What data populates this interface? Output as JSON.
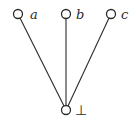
{
  "diagram": {
    "type": "hasse-diagram",
    "nodes": [
      {
        "id": "a",
        "label": "a",
        "cx": 18,
        "cy": 14,
        "r": 4.5,
        "label_x": 30,
        "label_y": 19
      },
      {
        "id": "b",
        "label": "b",
        "cx": 66,
        "cy": 14,
        "r": 4.5,
        "label_x": 76,
        "label_y": 19
      },
      {
        "id": "c",
        "label": "c",
        "cx": 111,
        "cy": 14,
        "r": 4.5,
        "label_x": 121,
        "label_y": 19
      },
      {
        "id": "bottom",
        "label": "⊥",
        "cx": 66,
        "cy": 110,
        "r": 4.5,
        "label_x": 75,
        "label_y": 115
      }
    ],
    "edges": [
      {
        "from": "bottom",
        "to": "a"
      },
      {
        "from": "bottom",
        "to": "b"
      },
      {
        "from": "bottom",
        "to": "c"
      }
    ],
    "colors": {
      "stroke": "#2b2b2b",
      "background": "#ffffff"
    }
  }
}
